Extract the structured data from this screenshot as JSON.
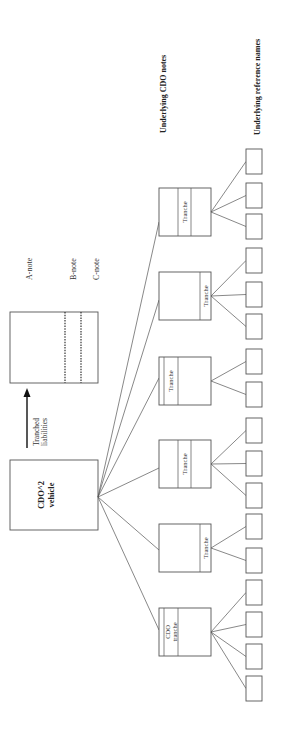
{
  "diagram": {
    "vehicle": {
      "line1": "CDO^2",
      "line2": "vehicle"
    },
    "arrow_label": {
      "line1": "Tranched",
      "line2": "liabilities"
    },
    "liability_notes": [
      "A-note",
      "B-note",
      "C-note"
    ],
    "headings": {
      "cdo_notes": "Underlying CDO notes",
      "reference_names": "Underlying reference names"
    },
    "cdo_notes": [
      {
        "label": "Tranche",
        "band_position": "middle",
        "reference_count": 3
      },
      {
        "label": "Tranche",
        "band_position": "senior",
        "reference_count": 3
      },
      {
        "label": "Tranche",
        "band_position": "junior",
        "reference_count": 2
      },
      {
        "label": "Tranche",
        "band_position": "middle",
        "reference_count": 3
      },
      {
        "label": "Tranche",
        "band_position": "senior",
        "reference_count": 2
      },
      {
        "label": "CDO tranche",
        "label_line1": "CDO",
        "label_line2": "tranche",
        "band_position": "junior",
        "reference_count": 4
      }
    ]
  }
}
